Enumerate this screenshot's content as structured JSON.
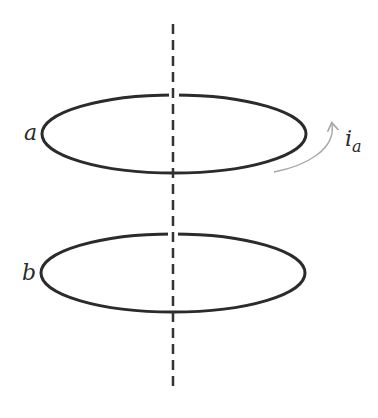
{
  "diagram": {
    "type": "coaxial-current-loops",
    "axis": {
      "style": "dashed",
      "color": "#333333"
    },
    "loops": [
      {
        "id": "a",
        "label": "a",
        "cx": 174,
        "cy": 134,
        "rx": 132,
        "ry": 39
      },
      {
        "id": "b",
        "label": "b",
        "cx": 173,
        "cy": 273,
        "rx": 132,
        "ry": 39
      }
    ],
    "current": {
      "label_main": "i",
      "label_sub": "a",
      "arrow_color": "#a8a8a8",
      "direction": "counterclockwise-upward"
    }
  },
  "colors": {
    "loop_stroke": "#2b2b2b",
    "axis_stroke": "#333333",
    "arrow": "#a8a8a8",
    "text": "#2a2a2a"
  }
}
